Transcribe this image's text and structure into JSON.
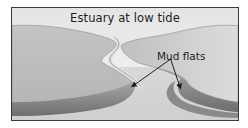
{
  "diagram": {
    "title": "Estuary at low tide",
    "labels": [
      {
        "text": "Mud flats",
        "arrow_targets": [
          "left mud flat",
          "right mud flat"
        ]
      }
    ],
    "regions": [
      "sky",
      "left bank",
      "right bank",
      "river channel",
      "left mud flat",
      "right mud flat",
      "estuary floor"
    ]
  },
  "colors": {
    "sky": "#f2f2f2",
    "bank": "#bdbdbd",
    "channel": "#dadada",
    "mudflat": "#8e8e8e",
    "frame": "#3a3a3a",
    "text": "#1e1e1e"
  }
}
